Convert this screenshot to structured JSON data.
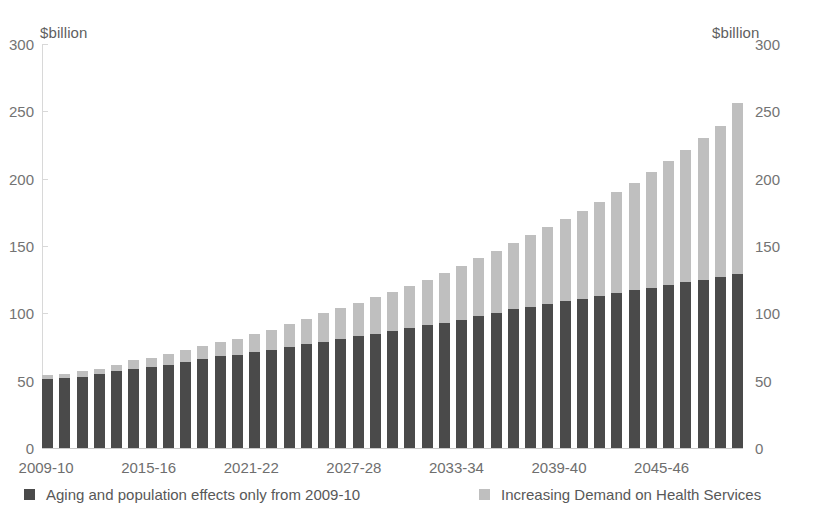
{
  "chart_data": {
    "type": "bar",
    "stacked": true,
    "title": "",
    "subtitle": "",
    "xlabel": "",
    "ylabel": "$billion",
    "ylabel_right": "$billion",
    "ylim": [
      0,
      300
    ],
    "yticks": [
      0,
      50,
      100,
      150,
      200,
      250,
      300
    ],
    "yticks_right": [
      0,
      50,
      100,
      150,
      200,
      250,
      300
    ],
    "grid": false,
    "legend_position": "bottom",
    "categories": [
      "2009-10",
      "2010-11",
      "2011-12",
      "2012-13",
      "2013-14",
      "2014-15",
      "2015-16",
      "2016-17",
      "2017-18",
      "2018-19",
      "2019-20",
      "2020-21",
      "2021-22",
      "2022-23",
      "2023-24",
      "2024-25",
      "2025-26",
      "2026-27",
      "2027-28",
      "2028-29",
      "2029-30",
      "2030-31",
      "2031-32",
      "2032-33",
      "2033-34",
      "2034-35",
      "2035-36",
      "2036-37",
      "2037-38",
      "2038-39",
      "2039-40",
      "2040-41",
      "2041-42",
      "2042-43",
      "2043-44",
      "2044-45",
      "2045-46",
      "2046-47",
      "2047-48",
      "2048-49",
      "2049-50"
    ],
    "tick_labels": [
      "2009-10",
      "2015-16",
      "2021-22",
      "2027-28",
      "2033-34",
      "2039-40",
      "2045-46"
    ],
    "tick_label_indices": [
      0,
      6,
      12,
      18,
      24,
      30,
      36
    ],
    "series": [
      {
        "name": "Aging and population effects only from 2009-10",
        "color": "#4a4a4a",
        "values": [
          51,
          52,
          53,
          55,
          57,
          59,
          60,
          62,
          64,
          66,
          68,
          69,
          71,
          73,
          75,
          77,
          79,
          81,
          83,
          85,
          87,
          89,
          91,
          93,
          95,
          98,
          100,
          103,
          105,
          107,
          109,
          111,
          113,
          115,
          117,
          119,
          121,
          123,
          125,
          127,
          129
        ]
      },
      {
        "name": "Increasing Demand on Health Services",
        "color": "#bfbfbf",
        "values": [
          3,
          3,
          4,
          4,
          5,
          6,
          7,
          8,
          9,
          10,
          11,
          12,
          14,
          15,
          17,
          19,
          21,
          23,
          25,
          27,
          29,
          31,
          34,
          37,
          40,
          43,
          46,
          49,
          53,
          57,
          61,
          65,
          70,
          75,
          80,
          86,
          92,
          98,
          105,
          112,
          127
        ]
      }
    ],
    "totals": [
      54,
      55,
      57,
      59,
      62,
      65,
      67,
      70,
      73,
      76,
      79,
      81,
      85,
      88,
      92,
      96,
      100,
      104,
      108,
      112,
      116,
      120,
      125,
      130,
      135,
      141,
      146,
      152,
      158,
      164,
      170,
      176,
      183,
      190,
      197,
      205,
      213,
      221,
      230,
      239,
      256
    ]
  },
  "axes": {
    "left_unit": "$billion",
    "right_unit": "$billion"
  },
  "legend": {
    "items": [
      {
        "label": "Aging and population effects only from 2009-10",
        "swatch": "dark"
      },
      {
        "label": "Increasing Demand on Health Services",
        "swatch": "light"
      }
    ]
  }
}
